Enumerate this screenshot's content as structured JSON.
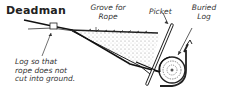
{
  "diagram": {
    "title": "Deadman",
    "labels": {
      "grove": [
        "Grove for",
        "Rope"
      ],
      "picket": "Picket",
      "buried_log": [
        "Buried",
        "Log"
      ],
      "log_note": [
        "Log so that",
        "rope does not",
        "cut into ground."
      ]
    },
    "colors": {
      "ink": "#222222",
      "background": "#ffffff"
    }
  }
}
